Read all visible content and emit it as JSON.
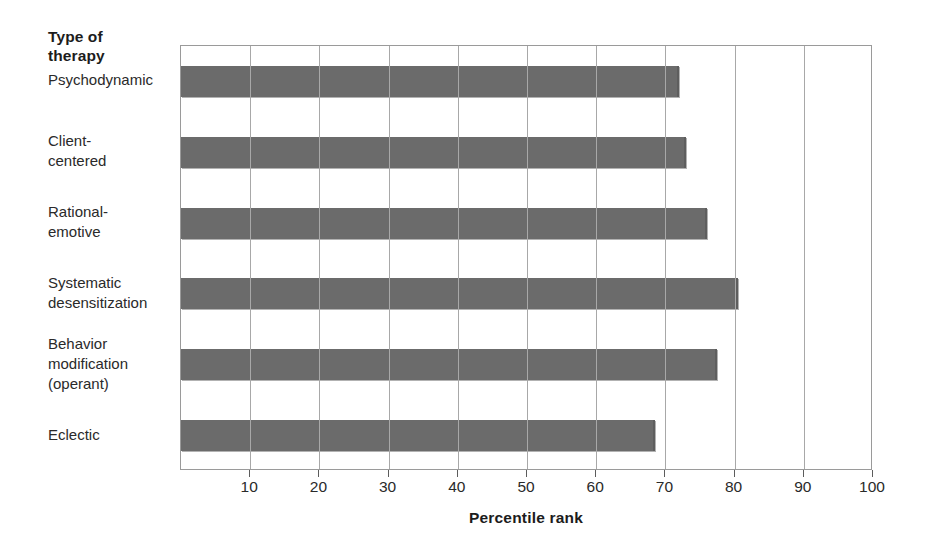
{
  "chart_data": {
    "type": "bar",
    "orientation": "horizontal",
    "title": "",
    "xlabel": "Percentile rank",
    "ylabel": "Type of therapy",
    "ylabel_lines": [
      "Type of",
      "therapy"
    ],
    "xlim": [
      0,
      100
    ],
    "xticks": [
      10,
      20,
      30,
      40,
      50,
      60,
      70,
      80,
      90,
      100
    ],
    "xtick_labels": [
      "10",
      "20",
      "30",
      "40",
      "50",
      "60",
      "70",
      "80",
      "90",
      "100"
    ],
    "grid": "vertical-only",
    "legend": "none",
    "bar_color": "#6b6b6b",
    "axis_color": "#9a9a9a",
    "categories": [
      "Psychodynamic",
      "Client-centered",
      "Rational-emotive",
      "Systematic desensitization",
      "Behavior modification (operant)",
      "Eclectic"
    ],
    "category_label_lines": [
      [
        "Psychodynamic"
      ],
      [
        "Client-",
        "centered"
      ],
      [
        "Rational-",
        "emotive"
      ],
      [
        "Systematic",
        "desensitization"
      ],
      [
        "Behavior",
        "modification",
        "(operant)"
      ],
      [
        "Eclectic"
      ]
    ],
    "values": [
      72,
      73,
      76,
      80.5,
      77.5,
      68.5
    ]
  }
}
